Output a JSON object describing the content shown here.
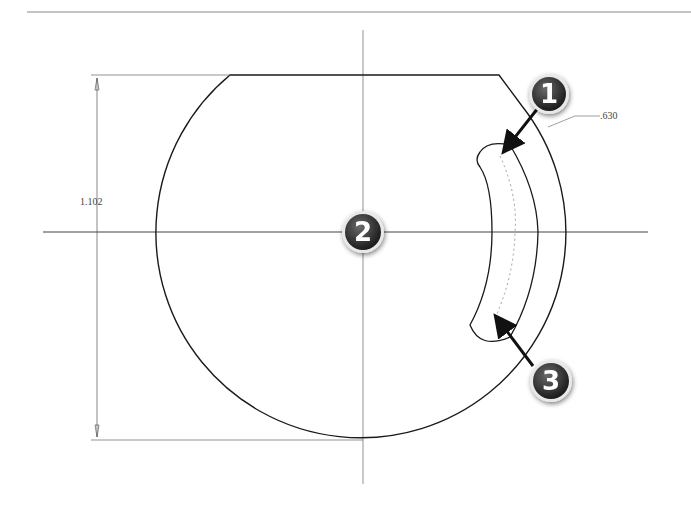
{
  "drawing": {
    "title": "Sketch with slot and dimensions",
    "dimensions": {
      "height_label": "1.102",
      "radius_label": ".630"
    },
    "callouts": [
      {
        "number": "1",
        "target": "slot-outer-arc"
      },
      {
        "number": "2",
        "target": "center-point"
      },
      {
        "number": "3",
        "target": "slot-centerline"
      }
    ],
    "colors": {
      "line": "#1a1a1a",
      "construction": "#777777",
      "badge_fill": "#3a3a3a",
      "badge_rim": "#dddddd",
      "background": "#ffffff"
    }
  }
}
